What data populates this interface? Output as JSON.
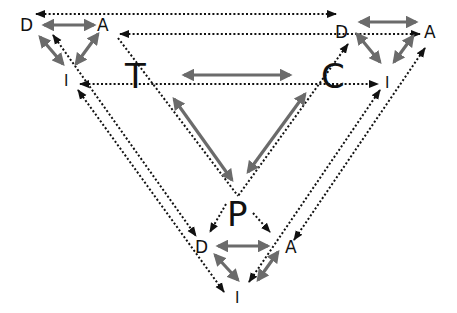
{
  "diagram": {
    "type": "nested-triangles",
    "colors": {
      "solid_arrow": "#6b6b6b",
      "dotted_arrow": "#111111",
      "label": "#111111",
      "background": "#ffffff"
    },
    "center_triangle": {
      "nodes": [
        {
          "id": "T",
          "label": "T",
          "x": 140,
          "y": 76
        },
        {
          "id": "C",
          "label": "C",
          "x": 338,
          "y": 76
        },
        {
          "id": "P",
          "label": "P",
          "x": 238,
          "y": 212
        }
      ],
      "double_arrows": [
        {
          "from": "T",
          "to": "C"
        },
        {
          "from": "T",
          "to": "P"
        },
        {
          "from": "C",
          "to": "P"
        }
      ]
    },
    "left_triangle": {
      "nodes": [
        {
          "id": "D1",
          "label": "D",
          "x": 26,
          "y": 25
        },
        {
          "id": "A1",
          "label": "A",
          "x": 104,
          "y": 25
        },
        {
          "id": "I1",
          "label": "I",
          "x": 67,
          "y": 80
        }
      ]
    },
    "right_triangle": {
      "nodes": [
        {
          "id": "D2",
          "label": "D",
          "x": 342,
          "y": 31
        },
        {
          "id": "A2",
          "label": "A",
          "x": 431,
          "y": 31
        },
        {
          "id": "I2",
          "label": "I",
          "x": 388,
          "y": 82
        }
      ]
    },
    "bottom_triangle": {
      "nodes": [
        {
          "id": "D3",
          "label": "D",
          "x": 202,
          "y": 246
        },
        {
          "id": "A3",
          "label": "A",
          "x": 291,
          "y": 246
        },
        {
          "id": "I3",
          "label": "I",
          "x": 238,
          "y": 298
        }
      ]
    }
  },
  "labels": {
    "T": "T",
    "C": "C",
    "P": "P",
    "left_D": "D",
    "left_A": "A",
    "left_I": "I",
    "right_D": "D",
    "right_A": "A",
    "right_I": "I",
    "bottom_D": "D",
    "bottom_A": "A",
    "bottom_I": "I"
  }
}
